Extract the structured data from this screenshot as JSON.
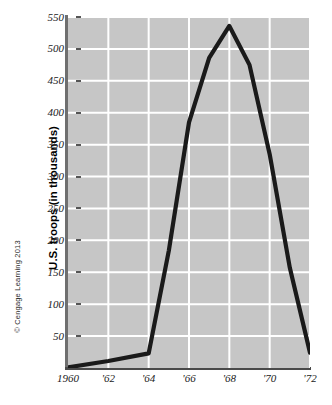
{
  "figure": {
    "credit": "© Cengage Learning 2013"
  },
  "chart_data": {
    "type": "line",
    "title": "",
    "xlabel": "",
    "ylabel": "U.S. troops (in thousands)",
    "xlim": [
      1960,
      1972
    ],
    "ylim": [
      0,
      550
    ],
    "grid": true,
    "legend": false,
    "y_ticks": [
      550,
      500,
      450,
      400,
      350,
      300,
      250,
      200,
      150,
      100,
      50
    ],
    "y_tick_labels": [
      "550",
      "500",
      "450",
      "400",
      "350",
      "300",
      "250",
      "200",
      "150",
      "100",
      "50"
    ],
    "x_ticks": [
      1960,
      1962,
      1964,
      1966,
      1968,
      1970,
      1972
    ],
    "x_tick_labels": [
      "1960",
      "'62",
      "'64",
      "'66",
      "'68",
      "'70",
      "'72"
    ],
    "series": [
      {
        "name": "U.S. troops in Vietnam",
        "color": "#1a1a1a",
        "x": [
          1960,
          1962,
          1964,
          1965,
          1966,
          1967,
          1968,
          1969,
          1970,
          1971,
          1972
        ],
        "values": [
          1,
          11,
          23,
          184,
          385,
          486,
          536,
          475,
          335,
          157,
          24
        ]
      }
    ],
    "colors": {
      "plot_background": "#c6c6c6",
      "gridline": "#ffffff",
      "line": "#1a1a1a",
      "axis": "#555555",
      "text": "#1a1a1a"
    }
  }
}
